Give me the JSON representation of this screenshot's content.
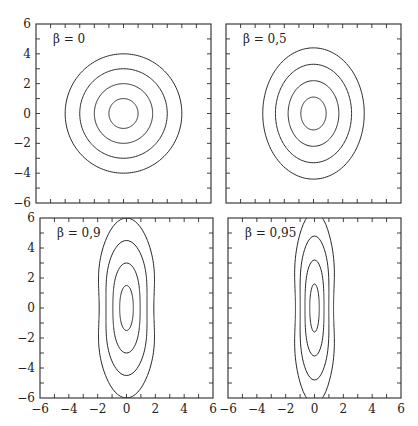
{
  "chart_data": [
    {
      "type": "contour",
      "annotation": "β = 0",
      "beta": 0,
      "xlim": [
        -6,
        6
      ],
      "ylim": [
        -6,
        6
      ],
      "xticks_labeled": [],
      "yticks_labeled": [
        "−6",
        "−4",
        "−2",
        "0",
        "2",
        "4",
        "6"
      ],
      "levels": [
        1,
        2,
        3,
        4
      ],
      "shape": {
        "sx": 1.0,
        "sy": 1.0,
        "waist": 0.0
      },
      "contour_extents": [
        {
          "x": 1,
          "y": 1
        },
        {
          "x": 2,
          "y": 2
        },
        {
          "x": 3,
          "y": 3
        },
        {
          "x": 4,
          "y": 4
        }
      ]
    },
    {
      "type": "contour",
      "annotation": "β = 0,5",
      "beta": 0.5,
      "xlim": [
        -6,
        6
      ],
      "ylim": [
        -6,
        6
      ],
      "xticks_labeled": [],
      "yticks_labeled": [],
      "levels": [
        1,
        2,
        3,
        4
      ],
      "shape": {
        "sx": 0.87,
        "sy": 1.1,
        "waist": 0.0
      },
      "contour_extents": [
        {
          "x": 0.85,
          "y": 1.1
        },
        {
          "x": 1.7,
          "y": 2.2
        },
        {
          "x": 2.6,
          "y": 3.3
        },
        {
          "x": 3.5,
          "y": 4.4
        }
      ]
    },
    {
      "type": "contour",
      "annotation": "β = 0,9",
      "beta": 0.9,
      "xlim": [
        -6,
        6
      ],
      "ylim": [
        -6,
        6
      ],
      "xticks_labeled": [
        "−6",
        "−4",
        "−2",
        "0",
        "2",
        "4",
        "6"
      ],
      "yticks_labeled": [
        "−6",
        "−4",
        "−2",
        "0",
        "2",
        "4",
        "6"
      ],
      "levels": [
        1,
        2,
        3,
        4
      ],
      "shape": {
        "sx": 0.5,
        "sy": 1.5,
        "waist": 0.35
      },
      "contour_extents": [
        {
          "x": 0.5,
          "y": 1.5
        },
        {
          "x": 1.0,
          "y": 3.0
        },
        {
          "x": 1.35,
          "y": 4.5
        },
        {
          "x": 1.8,
          "y": 6.0
        }
      ]
    },
    {
      "type": "contour",
      "annotation": "β = 0,95",
      "beta": 0.95,
      "xlim": [
        -6,
        6
      ],
      "ylim": [
        -6,
        6
      ],
      "xticks_labeled": [
        "−6",
        "−4",
        "−2",
        "0",
        "2",
        "4",
        "6"
      ],
      "yticks_labeled": [],
      "levels": [
        1,
        2,
        3,
        4
      ],
      "shape": {
        "sx": 0.35,
        "sy": 1.6,
        "waist": 0.45
      },
      "contour_extents": [
        {
          "x": 0.35,
          "y": 1.6
        },
        {
          "x": 0.7,
          "y": 3.3
        },
        {
          "x": 1.0,
          "y": 4.9
        },
        {
          "x": 1.3,
          "y": 6.5
        }
      ]
    }
  ]
}
